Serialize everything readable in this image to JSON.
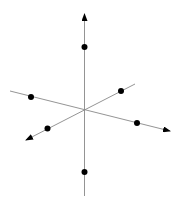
{
  "diagram": {
    "type": "3d-coordinate-axes-with-points",
    "width": 179,
    "height": 204,
    "colors": {
      "background": "#ffffff",
      "axis": "#888888",
      "point": "#000000",
      "arrow": "#000000"
    },
    "origin": [
      84.5,
      110
    ],
    "axes": [
      {
        "name": "vertical-axis",
        "from": [
          84.5,
          196
        ],
        "to": [
          84.5,
          14
        ],
        "arrow_at": "to"
      },
      {
        "name": "horizontal-axis",
        "from": [
          10,
          91
        ],
        "to": [
          170,
          131
        ],
        "arrow_at": "to"
      },
      {
        "name": "depth-axis",
        "from": [
          135,
          84
        ],
        "to": [
          26,
          140
        ],
        "arrow_at": "to"
      }
    ],
    "points": [
      {
        "name": "point-top",
        "cx": 84.5,
        "cy": 47
      },
      {
        "name": "point-bottom",
        "cx": 84.5,
        "cy": 172
      },
      {
        "name": "point-left",
        "cx": 31,
        "cy": 97
      },
      {
        "name": "point-right",
        "cx": 137,
        "cy": 123
      },
      {
        "name": "point-upper-right",
        "cx": 121,
        "cy": 91
      },
      {
        "name": "point-lower-left",
        "cx": 47.5,
        "cy": 128.5
      }
    ],
    "point_radius": 3
  }
}
